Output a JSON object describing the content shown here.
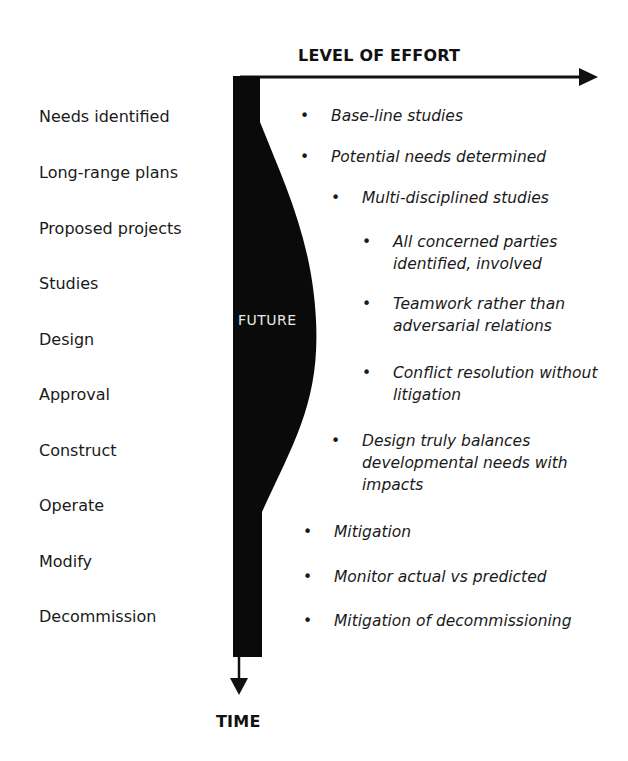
{
  "axes": {
    "x_label": "LEVEL OF EFFORT",
    "y_label": "TIME"
  },
  "band_label": "FUTURE",
  "stages": [
    {
      "label": "Needs identified",
      "top": 107
    },
    {
      "label": "Long-range plans",
      "top": 163
    },
    {
      "label": "Proposed projects",
      "top": 219
    },
    {
      "label": "Studies",
      "top": 274
    },
    {
      "label": "Design",
      "top": 330
    },
    {
      "label": "Approval",
      "top": 385
    },
    {
      "label": "Construct",
      "top": 441
    },
    {
      "label": "Operate",
      "top": 496
    },
    {
      "label": "Modify",
      "top": 552
    },
    {
      "label": "Decommission",
      "top": 607
    }
  ],
  "activities": [
    {
      "text": "Base-line studies",
      "level": 0
    },
    {
      "text": "Potential needs determined",
      "level": 0
    },
    {
      "text": "Multi-disciplined studies",
      "level": 1
    },
    {
      "text": "All concerned parties identified, involved",
      "level": 2
    },
    {
      "text": "Teamwork rather than adversarial relations",
      "level": 2
    },
    {
      "text": "Conflict resolution without litigation",
      "level": 2
    },
    {
      "text": "Design truly balances developmental needs with impacts",
      "level": 1
    },
    {
      "text": "Mitigation",
      "level": 0
    },
    {
      "text": "Monitor actual vs predicted",
      "level": 0
    },
    {
      "text": "Mitigation of decommissioning",
      "level": 0
    }
  ],
  "bullet_glyph": "•",
  "colors": {
    "ink": "#0a0a0a",
    "text": "#1a1a1a",
    "band_text": "#e8e8e8",
    "background": "#ffffff"
  }
}
